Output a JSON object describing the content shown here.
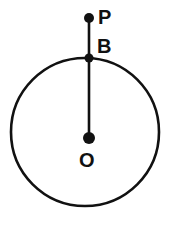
{
  "figure": {
    "type": "geometry-diagram",
    "background_color": "#ffffff",
    "stroke_color": "#111111",
    "canvas": {
      "width": 179,
      "height": 227
    }
  },
  "circle": {
    "name": "circle-O",
    "center_x": 85,
    "center_y": 132,
    "radius": 74,
    "stroke_width": 2.6,
    "fill": "none"
  },
  "segment": {
    "name": "segment-PO",
    "x1": 89,
    "y1": 18,
    "x2": 89,
    "y2": 138,
    "stroke_width": 2.6
  },
  "points": [
    {
      "id": "P",
      "label": "P",
      "x": 89,
      "y": 18,
      "radius": 5,
      "label_x": 98,
      "label_y": 7,
      "role": "external-point"
    },
    {
      "id": "B",
      "label": "B",
      "x": 89,
      "y": 58,
      "radius": 4.5,
      "label_x": 97,
      "label_y": 36,
      "role": "point-on-circle"
    },
    {
      "id": "O",
      "label": "O",
      "x": 89,
      "y": 138,
      "radius": 6,
      "label_x": 79,
      "label_y": 150,
      "role": "center"
    }
  ]
}
